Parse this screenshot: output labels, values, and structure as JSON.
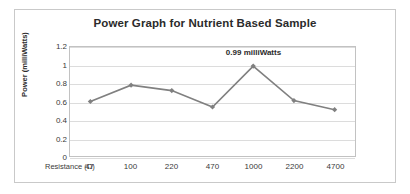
{
  "chart_data": {
    "type": "line",
    "title": "Power Graph for Nutrient Based Sample",
    "xlabel": "Resistance (Ω)",
    "ylabel": "Power (milliWatts)",
    "categories": [
      "47",
      "100",
      "220",
      "470",
      "1000",
      "2200",
      "4700"
    ],
    "values": [
      0.6,
      0.78,
      0.72,
      0.54,
      0.99,
      0.61,
      0.51
    ],
    "ylim": [
      0,
      1.2
    ],
    "yticks": [
      "0",
      "0.2",
      "0.4",
      "0.6",
      "0.8",
      "1",
      "1.2"
    ],
    "ytick_values": [
      0,
      0.2,
      0.4,
      0.6,
      0.8,
      1,
      1.2
    ],
    "grid": true,
    "legend": "none",
    "series_color": "#808080",
    "gridline_color": "#dcdcdc",
    "annotations": [
      {
        "text": "0.99 milliWatts",
        "category": "1000",
        "value": 0.99
      }
    ]
  }
}
